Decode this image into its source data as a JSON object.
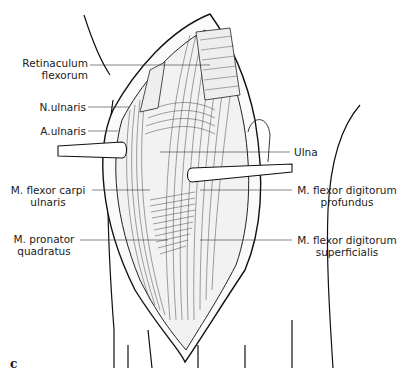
{
  "figure": {
    "panel_letter": "c",
    "labels_left": [
      {
        "line1": "Retinaculum",
        "line2": "flexorum"
      },
      {
        "line1": "N.ulnaris",
        "line2": ""
      },
      {
        "line1": "A.ulnaris",
        "line2": ""
      },
      {
        "line1": "M. flexor carpi",
        "line2": "ulnaris"
      },
      {
        "line1": "M. pronator",
        "line2": "quadratus"
      }
    ],
    "labels_right": [
      {
        "line1": "Ulna",
        "line2": ""
      },
      {
        "line1": "M. flexor digitorum",
        "line2": "profundus"
      },
      {
        "line1": "M. flexor digitorum",
        "line2": "superficialis"
      }
    ]
  }
}
